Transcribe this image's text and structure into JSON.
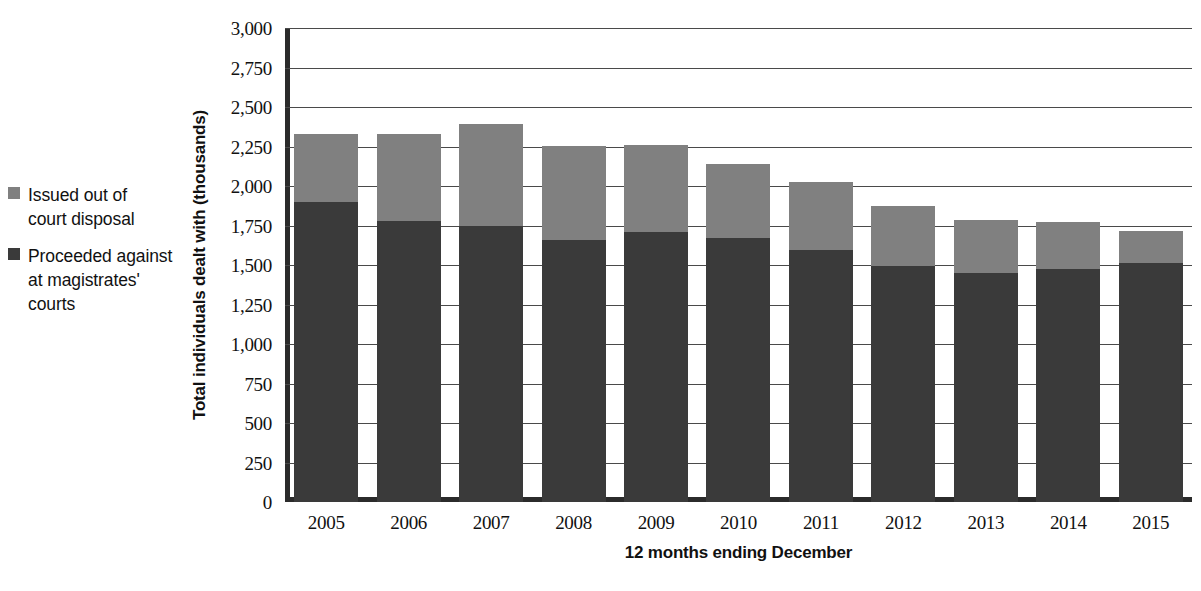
{
  "chart_data": {
    "type": "bar",
    "stacked": true,
    "title": "",
    "xlabel": "12 months ending December",
    "ylabel": "Total individuals dealt with (thousands)",
    "categories": [
      "2005",
      "2006",
      "2007",
      "2008",
      "2009",
      "2010",
      "2011",
      "2012",
      "2013",
      "2014",
      "2015"
    ],
    "series": [
      {
        "name": "Proceeded against at magistrates' courts",
        "color": "#3a3a3a",
        "values": [
          1900,
          1780,
          1750,
          1660,
          1710,
          1670,
          1595,
          1495,
          1450,
          1475,
          1510
        ]
      },
      {
        "name": "Issued out of court disposal",
        "color": "#808080",
        "values": [
          430,
          550,
          640,
          595,
          550,
          470,
          430,
          380,
          335,
          295,
          205
        ]
      }
    ],
    "totals": [
      2330,
      2330,
      2390,
      2255,
      2260,
      2140,
      2025,
      1875,
      1785,
      1770,
      1715
    ],
    "ylim": [
      0,
      3000
    ],
    "ytick_step": 250,
    "yticks": [
      "3,000",
      "2,750",
      "2,500",
      "2,250",
      "2,000",
      "1,750",
      "1,500",
      "1,250",
      "1,000",
      "750",
      "500",
      "250",
      "0"
    ],
    "ytick_values": [
      3000,
      2750,
      2500,
      2250,
      2000,
      1750,
      1500,
      1250,
      1000,
      750,
      500,
      250,
      0
    ],
    "grid": true,
    "legend_position": "left"
  },
  "legend": {
    "items": [
      {
        "label": "Issued out of\ncourt disposal",
        "color": "#808080"
      },
      {
        "label": "Proceeded against\nat magistrates'\ncourts",
        "color": "#3a3a3a"
      }
    ]
  },
  "footnote": {
    "text": ""
  }
}
